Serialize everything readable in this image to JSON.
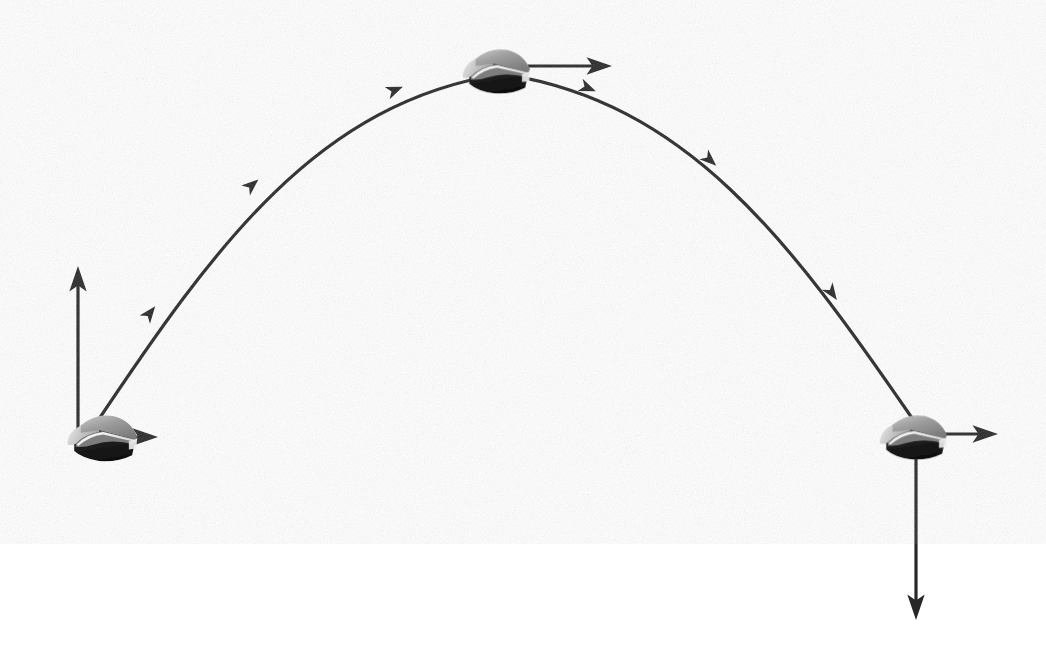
{
  "figure": {
    "title": "Projectile motion trajectory diagram",
    "background_color": "#ffffff",
    "width": 1046,
    "height": 647,
    "stroke_color": "#272727",
    "caption": ""
  },
  "palette": {
    "ink": "#272727",
    "object_highlight": "#f2f2f2",
    "object_light": "#d3d3d3",
    "object_mid": "#9a9a9a",
    "object_shade": "#6e6e6e",
    "object_dark": "#1a1a1a",
    "background": "#ffffff"
  },
  "trajectory": {
    "label": "parabolic-flight-path",
    "type": "parabola",
    "stroke_width": 3.2,
    "start": {
      "x": 93,
      "y": 428
    },
    "apex": {
      "x": 502,
      "y": 74
    },
    "end": {
      "x": 912,
      "y": 418
    },
    "points": [
      {
        "x": 93,
        "y": 428
      },
      {
        "x": 150,
        "y": 313
      },
      {
        "x": 252,
        "y": 185
      },
      {
        "x": 395,
        "y": 90
      },
      {
        "x": 502,
        "y": 74
      },
      {
        "x": 588,
        "y": 88
      },
      {
        "x": 710,
        "y": 160
      },
      {
        "x": 832,
        "y": 293
      },
      {
        "x": 912,
        "y": 418
      }
    ],
    "direction_markers": [
      {
        "name": "ascent-marker-1",
        "x": 150,
        "y": 313,
        "angle": -52
      },
      {
        "name": "ascent-marker-2",
        "x": 252,
        "y": 185,
        "angle": -41
      },
      {
        "name": "ascent-marker-3",
        "x": 395,
        "y": 90,
        "angle": -22
      },
      {
        "name": "descent-marker-1",
        "x": 588,
        "y": 88,
        "angle": 22
      },
      {
        "name": "descent-marker-2",
        "x": 710,
        "y": 160,
        "angle": 42
      },
      {
        "name": "descent-marker-3",
        "x": 832,
        "y": 293,
        "angle": 55
      }
    ]
  },
  "objects": [
    {
      "id": "launch",
      "name": "projectile-at-launch",
      "x": 104,
      "y": 437,
      "width": 86,
      "height": 58,
      "caption": ""
    },
    {
      "id": "apex",
      "name": "projectile-at-apex",
      "x": 498,
      "y": 70,
      "width": 80,
      "height": 56,
      "caption": ""
    },
    {
      "id": "landing",
      "name": "projectile-at-landing",
      "x": 915,
      "y": 436,
      "width": 82,
      "height": 56,
      "caption": ""
    }
  ],
  "vectors": [
    {
      "id": "launch-vertical",
      "name": "launch-vertical-velocity-arrow",
      "from": {
        "x": 78,
        "y": 440
      },
      "to": {
        "x": 78,
        "y": 266
      },
      "direction": "up",
      "stroke_width": 3.2,
      "head_size": 15,
      "label": ""
    },
    {
      "id": "launch-horizontal",
      "name": "launch-horizontal-velocity-arrow",
      "from": {
        "x": 88,
        "y": 437
      },
      "to": {
        "x": 158,
        "y": 437
      },
      "direction": "right",
      "stroke_width": 3.2,
      "head_size": 15,
      "label": ""
    },
    {
      "id": "apex-horizontal",
      "name": "apex-horizontal-velocity-arrow",
      "from": {
        "x": 528,
        "y": 66
      },
      "to": {
        "x": 612,
        "y": 66
      },
      "direction": "right",
      "stroke_width": 3.2,
      "head_size": 15,
      "label": ""
    },
    {
      "id": "landing-horizontal",
      "name": "landing-horizontal-velocity-arrow",
      "from": {
        "x": 928,
        "y": 434
      },
      "to": {
        "x": 998,
        "y": 434
      },
      "direction": "right",
      "stroke_width": 3.2,
      "head_size": 15,
      "label": ""
    },
    {
      "id": "landing-vertical",
      "name": "landing-vertical-velocity-arrow",
      "from": {
        "x": 916,
        "y": 444
      },
      "to": {
        "x": 916,
        "y": 620
      },
      "direction": "down",
      "stroke_width": 3.2,
      "head_size": 15,
      "label": ""
    }
  ]
}
